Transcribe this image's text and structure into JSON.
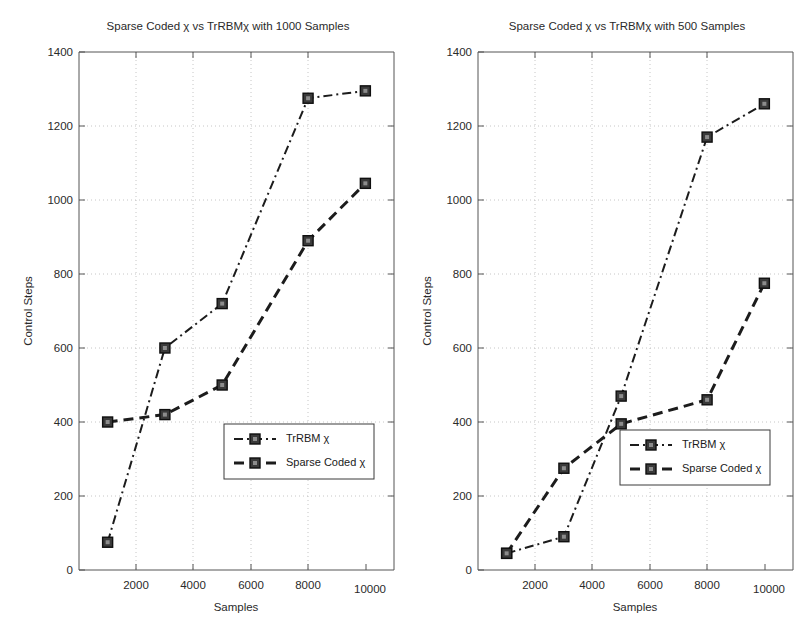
{
  "figure": {
    "axis_label_y": "Control Steps",
    "axis_label_x": "Samples",
    "marker_name": "square-marker"
  },
  "chart_data": [
    {
      "type": "line",
      "title": "Sparse Coded χ vs TrRBMχ with 1000 Samples",
      "xlabel": "Samples",
      "ylabel": "Control Steps",
      "xlim": [
        0,
        11000
      ],
      "ylim": [
        0,
        1400
      ],
      "xticks": [
        2000,
        4000,
        6000,
        8000,
        10000
      ],
      "yticks": [
        0,
        200,
        400,
        600,
        800,
        1000,
        1200,
        1400
      ],
      "grid": true,
      "legend_position": "center-right",
      "x": [
        1000,
        3000,
        5000,
        8000,
        10000
      ],
      "series": [
        {
          "name": "TrRBM χ",
          "style": "dash-dot",
          "values": [
            75,
            600,
            720,
            1275,
            1295
          ]
        },
        {
          "name": "Sparse Coded χ",
          "style": "dashed",
          "values": [
            400,
            420,
            500,
            890,
            1045
          ]
        }
      ]
    },
    {
      "type": "line",
      "title": "Sparse Coded χ vs TrRBMχ with 500 Samples",
      "xlabel": "Samples",
      "ylabel": "Control Steps",
      "xlim": [
        0,
        11000
      ],
      "ylim": [
        0,
        1400
      ],
      "xticks": [
        2000,
        4000,
        6000,
        8000,
        10000
      ],
      "yticks": [
        0,
        200,
        400,
        600,
        800,
        1000,
        1200,
        1400
      ],
      "grid": true,
      "legend_position": "center-right",
      "x": [
        1000,
        3000,
        5000,
        8000,
        10000
      ],
      "series": [
        {
          "name": "TrRBM χ",
          "style": "dash-dot",
          "values": [
            45,
            90,
            470,
            1170,
            1260
          ]
        },
        {
          "name": "Sparse Coded χ",
          "style": "dashed",
          "values": [
            45,
            275,
            395,
            460,
            775
          ]
        }
      ]
    }
  ],
  "ticklabels": {
    "y": [
      "0",
      "200",
      "400",
      "600",
      "800",
      "1000",
      "1200",
      "1400"
    ],
    "x": [
      "2000",
      "4000",
      "6000",
      "8000",
      "10000"
    ]
  }
}
